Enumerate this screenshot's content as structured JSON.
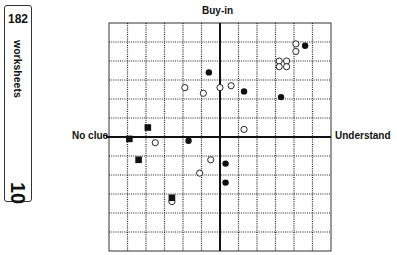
{
  "tab": {
    "page_number": "182",
    "section": "worksheets",
    "chapter": "10"
  },
  "chart_data": {
    "type": "scatter",
    "title": "",
    "axes": {
      "top": "Buy-in",
      "left": "No clue",
      "right": "Understand"
    },
    "grid": true,
    "grid_cells": [
      12,
      12
    ],
    "xlim": [
      -6,
      6
    ],
    "ylim": [
      -6,
      6
    ],
    "series": [
      {
        "name": "filled-circle",
        "marker": "circle-filled",
        "points": [
          [
            4.6,
            4.8
          ],
          [
            -0.6,
            3.4
          ],
          [
            1.3,
            2.4
          ],
          [
            3.3,
            2.1
          ],
          [
            -1.7,
            -0.2
          ],
          [
            0.3,
            -1.4
          ],
          [
            0.3,
            -2.4
          ]
        ]
      },
      {
        "name": "open-circle",
        "marker": "circle-open",
        "points": [
          [
            4.1,
            4.9
          ],
          [
            4.1,
            4.5
          ],
          [
            3.2,
            4.0
          ],
          [
            3.6,
            4.0
          ],
          [
            3.2,
            3.7
          ],
          [
            3.6,
            3.7
          ],
          [
            -1.9,
            2.6
          ],
          [
            -0.9,
            2.3
          ],
          [
            0.0,
            2.6
          ],
          [
            0.6,
            2.7
          ],
          [
            1.3,
            0.4
          ],
          [
            -3.5,
            -0.3
          ],
          [
            -0.5,
            -1.2
          ],
          [
            -1.1,
            -1.9
          ],
          [
            -2.6,
            -3.4
          ]
        ]
      },
      {
        "name": "filled-square",
        "marker": "square-filled",
        "points": [
          [
            -3.9,
            0.5
          ],
          [
            -4.9,
            -0.1
          ],
          [
            -4.4,
            -1.2
          ],
          [
            -2.6,
            -3.2
          ]
        ]
      }
    ]
  },
  "style": {
    "ink": "#111111",
    "grid_dot": "#222222",
    "background": "#ffffff"
  }
}
